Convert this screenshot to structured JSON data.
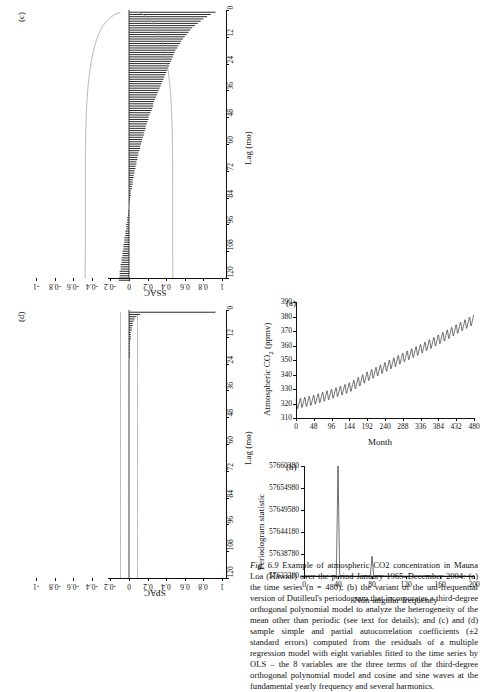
{
  "figure": {
    "label": "Fig. 6.9",
    "caption": "Example of atmospheric CO2 concentration in Mauna Loa (Hawaii) over the period January 1965–December 2004: (a) the time series (n = 480); (b) the variant of the uni-frequential version of Dutilleul's periodogram that incorporates a third-degree orthogonal polynomial model to analyze the heterogeneity of the mean other than periodic (see text for details); and (c) and (d) sample simple and partial autocorrelation coefficients (±2 standard errors) computed from the residuals of a multiple regression model with eight variables fitted to the time series by OLS – the 8 variables are the three terms of the third-degree orthogonal polynomial model and cosine and sine waves at the fundamental yearly frequency and several harmonics."
  },
  "chart_data": [
    {
      "id": "panel-a",
      "panel_label": "(a)",
      "type": "line",
      "title": "",
      "xlabel": "Month",
      "ylabel": "Atmospheric CO2 (ppmv)",
      "xticks": [
        0,
        48,
        96,
        144,
        192,
        240,
        288,
        336,
        384,
        432,
        480
      ],
      "yticks": [
        310,
        320,
        330,
        340,
        350,
        360,
        370,
        380,
        390
      ],
      "xlim": [
        0,
        480
      ],
      "ylim": [
        310,
        390
      ],
      "grid": false,
      "description": "Monthly mean CO2 rising from ~319 ppmv to ~378 ppmv with strong annual oscillation of about ±3 ppmv.",
      "series": [
        {
          "name": "CO2 concentration",
          "x": [
            0,
            48,
            96,
            144,
            192,
            240,
            288,
            336,
            384,
            432,
            480
          ],
          "values": [
            319.5,
            322.5,
            326.5,
            331.0,
            338.5,
            345.0,
            351.5,
            357.5,
            364.0,
            371.0,
            378.0
          ]
        }
      ]
    },
    {
      "id": "panel-b",
      "panel_label": "(b)",
      "type": "line",
      "title": "",
      "xlabel": "Non-angular frequency",
      "ylabel": "Periodogram statistic",
      "xticks": [
        0,
        40,
        80,
        120,
        160,
        200
      ],
      "yticks": [
        "57633380",
        "57638780",
        "57644180",
        "57649580",
        "57654980",
        "57660380"
      ],
      "xlim": [
        0,
        200
      ],
      "ylim": [
        57633380,
        57660380
      ],
      "grid": false,
      "description": "Flat baseline near 57633380 with a dominant sharp peak at frequency 40 reaching the top of the scale, and a small secondary peak near frequency 80.",
      "series": [
        {
          "name": "Dutilleul periodogram",
          "x": [
            0,
            20,
            38,
            40,
            42,
            60,
            78,
            80,
            82,
            120,
            160,
            200
          ],
          "values": [
            57633380,
            57633380,
            57633500,
            57660380,
            57633500,
            57633380,
            57633450,
            57638200,
            57633450,
            57633380,
            57633380,
            57633380
          ]
        }
      ]
    },
    {
      "id": "panel-c",
      "panel_label": "(c)",
      "type": "bar",
      "title": "",
      "xlabel": "Lag (mo)",
      "ylabel": "SSAC",
      "xticks": [
        0,
        12,
        24,
        36,
        48,
        60,
        72,
        84,
        96,
        108,
        120
      ],
      "yticks": [
        -1,
        -0.8,
        -0.6,
        -0.4,
        -0.2,
        0,
        0.2,
        0.4,
        0.6,
        0.8,
        1
      ],
      "xlim": [
        0,
        120
      ],
      "ylim": [
        -1,
        1
      ],
      "grid": false,
      "description": "Sample simple autocorrelation function of OLS residuals: slowly decaying positive values from about 0.93 at lag 1 down to near 0 by lag 95, then slightly negative. Confidence envelope of ±2 standard errors widens with lag.",
      "confidence_band": "±2 standard errors",
      "values": [
        0.93,
        0.88,
        0.84,
        0.8,
        0.77,
        0.74,
        0.71,
        0.68,
        0.66,
        0.64,
        0.62,
        0.6,
        0.58,
        0.56,
        0.55,
        0.53,
        0.52,
        0.5,
        0.49,
        0.48,
        0.47,
        0.46,
        0.45,
        0.44,
        0.43,
        0.42,
        0.41,
        0.4,
        0.39,
        0.38,
        0.37,
        0.36,
        0.35,
        0.34,
        0.33,
        0.32,
        0.31,
        0.3,
        0.29,
        0.28,
        0.27,
        0.26,
        0.26,
        0.25,
        0.24,
        0.23,
        0.22,
        0.21,
        0.21,
        0.2,
        0.19,
        0.18,
        0.18,
        0.17,
        0.16,
        0.16,
        0.15,
        0.14,
        0.14,
        0.13,
        0.12,
        0.12,
        0.11,
        0.1,
        0.1,
        0.09,
        0.09,
        0.08,
        0.08,
        0.07,
        0.07,
        0.06,
        0.06,
        0.05,
        0.05,
        0.04,
        0.04,
        0.04,
        0.03,
        0.03,
        0.02,
        0.02,
        0.02,
        0.01,
        0.01,
        0.01,
        0.0,
        0.0,
        0.0,
        -0.01,
        -0.01,
        -0.01,
        -0.02,
        -0.02,
        -0.02,
        -0.03,
        -0.03,
        -0.03,
        -0.04,
        -0.04,
        -0.04,
        -0.05,
        -0.05,
        -0.05,
        -0.06,
        -0.06,
        -0.06,
        -0.07,
        -0.07,
        -0.07,
        -0.08,
        -0.08,
        -0.08,
        -0.09,
        -0.09,
        -0.09,
        -0.1,
        -0.1,
        -0.1,
        -0.11,
        -0.11
      ]
    },
    {
      "id": "panel-d",
      "panel_label": "(d)",
      "type": "bar",
      "title": "",
      "xlabel": "Lag (mo)",
      "ylabel": "SPAC",
      "xticks": [
        0,
        12,
        24,
        36,
        48,
        60,
        72,
        84,
        96,
        108,
        120
      ],
      "yticks": [
        -1,
        -0.8,
        -0.6,
        -0.4,
        -0.2,
        0,
        0.2,
        0.4,
        0.6,
        0.8,
        1
      ],
      "xlim": [
        0,
        120
      ],
      "ylim": [
        -1,
        1
      ],
      "grid": false,
      "description": "Sample partial autocorrelation function of OLS residuals: large spike of about 0.93 at lag 1, then small values mostly within ±0.1 for the remaining lags.",
      "confidence_band": "±2 standard errors",
      "values": [
        0.93,
        0.12,
        0.08,
        0.06,
        0.05,
        0.04,
        0.04,
        0.03,
        0.03,
        0.02,
        0.02,
        0.02,
        0.02,
        0.01,
        0.01,
        0.01,
        0.01,
        0.01,
        0.01,
        0.01,
        0.01,
        0.0,
        0.0,
        0.0,
        0.0,
        0.0,
        0.0,
        0.0,
        0.0,
        0.0,
        0.0,
        0.0,
        0.0,
        0.0,
        0.0,
        0.0,
        0.0,
        0.0,
        0.0,
        0.0,
        0.0,
        0.0,
        0.0,
        0.0,
        0.0,
        0.0,
        0.0,
        0.0,
        0.0,
        0.0,
        0.0,
        0.0,
        0.0,
        0.0,
        0.0,
        0.0,
        0.0,
        0.0,
        0.0,
        0.0,
        0.0,
        0.0,
        0.0,
        0.0,
        0.0,
        0.0,
        0.0,
        0.0,
        0.0,
        0.0,
        0.0,
        0.0,
        0.0,
        0.0,
        0.0,
        0.0,
        0.0,
        0.0,
        0.0,
        0.0,
        0.0,
        0.0,
        0.0,
        0.0,
        0.0,
        0.0,
        0.0,
        0.0,
        0.0,
        0.0,
        0.0,
        0.0,
        0.0,
        0.0,
        0.0,
        0.0,
        0.0,
        0.0,
        0.0,
        0.0,
        0.0,
        0.0,
        0.0,
        0.0,
        0.0,
        0.0,
        0.0,
        0.0,
        0.0,
        0.0,
        0.0,
        0.0,
        0.0,
        0.0,
        0.0,
        0.0,
        0.0,
        0.0,
        0.0,
        0.0
      ]
    }
  ]
}
